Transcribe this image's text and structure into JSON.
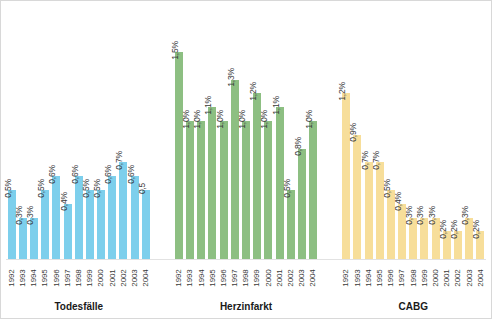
{
  "chart_data": {
    "type": "bar",
    "title": "",
    "xlabel": "",
    "ylabel": "",
    "ylim": [
      0,
      1.5
    ],
    "grid": false,
    "legend": "none",
    "categories": [
      "1992",
      "1993",
      "1994",
      "1995",
      "1996",
      "1997",
      "1998",
      "1999",
      "2000",
      "2001",
      "2002",
      "2003",
      "2004"
    ],
    "series": [
      {
        "name": "Todesfälle",
        "color": "#7dcfec",
        "values": [
          0.5,
          0.3,
          0.3,
          0.5,
          0.6,
          0.4,
          0.6,
          0.5,
          0.5,
          0.6,
          0.7,
          0.6,
          0.5
        ],
        "labels": [
          "0,5%",
          "0,3%",
          "0,3%",
          "0,5%",
          "0,6%",
          "0,4%",
          "0,6%",
          "0,5%",
          "0,5%",
          "0,6%",
          "0,7%",
          "0,6%",
          "0,5"
        ]
      },
      {
        "name": "Herzinfarkt",
        "color": "#8dbf82",
        "values": [
          1.5,
          1.0,
          1.0,
          1.1,
          1.0,
          1.3,
          1.0,
          1.2,
          1.0,
          1.1,
          0.5,
          0.8,
          1.0
        ],
        "labels": [
          "1,5%",
          "1,0%",
          "1,0%",
          "1,1%",
          "1,0%",
          "1,3%",
          "1,0%",
          "1,2%",
          "1,0%",
          "1,1%",
          "0,5%",
          "0,8%",
          "1,0%"
        ]
      },
      {
        "name": "CABG",
        "color": "#f7de9a",
        "values": [
          1.2,
          0.9,
          0.7,
          0.7,
          0.5,
          0.4,
          0.3,
          0.3,
          0.3,
          0.2,
          0.2,
          0.3,
          0.2
        ],
        "labels": [
          "1,2%",
          "0,9%",
          "0,7%",
          "0,7%",
          "0,5%",
          "0,4%",
          "0,3%",
          "0,3%",
          "0,3%",
          "0,2%",
          "0,2%",
          "0,3%",
          "0,2%"
        ]
      }
    ]
  },
  "colors": {
    "frame_border": "#d8d8d8",
    "axis_line": "#e2e2e2",
    "label_text": "#3a3a3a",
    "title_text": "#1a1a1a",
    "background": "#ffffff"
  }
}
